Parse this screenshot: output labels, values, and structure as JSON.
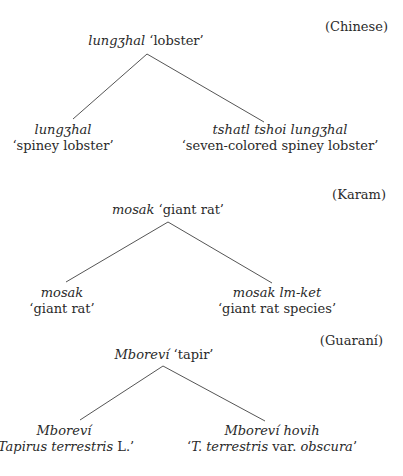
{
  "trees": [
    {
      "language": "(Chinese)",
      "root": {
        "term": "lungʒhal",
        "gloss": "‘lobster’"
      },
      "left": {
        "term": "lungʒhal",
        "gloss": "‘spiney lobster’"
      },
      "right": {
        "term": "tshatl tshoi lungʒhal",
        "gloss": "‘seven-colored spiney lobster’"
      }
    },
    {
      "language": "(Karam)",
      "root": {
        "term": "mosak",
        "gloss": "‘giant rat’"
      },
      "left": {
        "term": "mosak",
        "gloss": "‘giant rat’"
      },
      "right": {
        "term": "mosak lm-ket",
        "gloss": "‘giant rat species’"
      }
    },
    {
      "language": "(Guaraní)",
      "root": {
        "term": "Mboreví",
        "gloss": "‘tapir’"
      },
      "left": {
        "term": "Mboreví",
        "gloss_open": "‘",
        "gloss_italic": "Tapirus terrestris",
        "gloss_close": " L.’"
      },
      "right": {
        "term": "Mboreví hovih",
        "gloss_open": "‘",
        "gloss_italic1": "T. terrestris",
        "gloss_mid": " var. ",
        "gloss_italic2": "obscura",
        "gloss_close": "’"
      }
    }
  ]
}
